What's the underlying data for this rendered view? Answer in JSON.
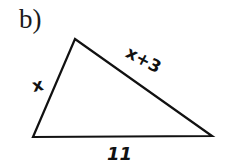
{
  "problem": {
    "part_label": "b)"
  },
  "triangle": {
    "vertices": {
      "top": [
        75,
        39
      ],
      "bottom_left": [
        33,
        137
      ],
      "bottom_right": [
        212,
        136
      ]
    },
    "sides": {
      "left": "x",
      "right": "x+3",
      "bottom": "11"
    },
    "stroke_color": "#111111"
  }
}
